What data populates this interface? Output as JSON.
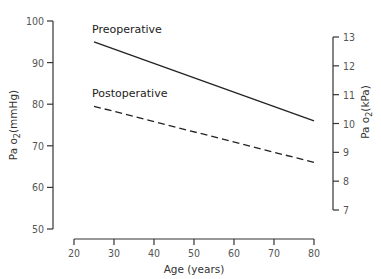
{
  "chart_data": {
    "type": "line",
    "title": "",
    "xlabel": "Age (years)",
    "ylabel": "Pa o2 (mmHg)",
    "ylabel_right": "Pa o2 (kPa)",
    "xlim": [
      20,
      80
    ],
    "ylim": [
      50,
      100
    ],
    "ylim_right": [
      7,
      13
    ],
    "x_ticks": [
      20,
      30,
      40,
      50,
      60,
      70,
      80
    ],
    "y_ticks": [
      50,
      60,
      70,
      80,
      90,
      100
    ],
    "y_ticks_right": [
      7,
      8,
      9,
      10,
      11,
      12,
      13
    ],
    "grid": false,
    "legend": "inline labels above lines",
    "series": [
      {
        "name": "Preoperative",
        "style": "solid",
        "x": [
          25,
          80
        ],
        "values": [
          95,
          76
        ]
      },
      {
        "name": "Postoperative",
        "style": "dashed",
        "x": [
          25,
          80
        ],
        "values": [
          79.5,
          66
        ]
      }
    ]
  },
  "colors": {
    "line": "#222222",
    "axis": "#333333",
    "text": "#555555",
    "background": "#ffffff"
  }
}
